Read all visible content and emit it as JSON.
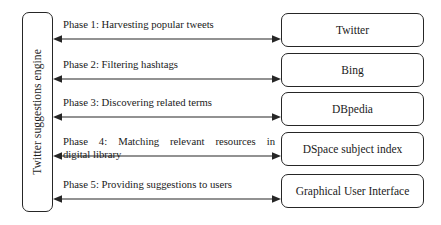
{
  "diagram": {
    "engine": {
      "label": "Twitter suggestions engine"
    },
    "line_color": "#262626",
    "background_color": "#ffffff",
    "phases": [
      {
        "id": "phase-1",
        "label": "Phase 1: Harvesting popular tweets",
        "label_lines": [
          "Phase 1: Harvesting popular tweets"
        ],
        "target": "Twitter",
        "arrow": "bidirectional",
        "justified": false
      },
      {
        "id": "phase-2",
        "label": "Phase 2: Filtering hashtags",
        "label_lines": [
          "Phase 2: Filtering hashtags"
        ],
        "target": "Bing",
        "arrow": "bidirectional",
        "justified": false
      },
      {
        "id": "phase-3",
        "label": "Phase 3: Discovering related terms",
        "label_lines": [
          "Phase 3: Discovering related terms"
        ],
        "target": "DBpedia",
        "arrow": "bidirectional",
        "justified": false
      },
      {
        "id": "phase-4",
        "label": "Phase 4: Matching relevant resources in digital library",
        "label_lines": [
          "Phase 4: Matching relevant resources in",
          "digital library"
        ],
        "target": "DSpace subject index",
        "arrow": "bidirectional",
        "justified": true
      },
      {
        "id": "phase-5",
        "label": "Phase 5: Providing suggestions to users",
        "label_lines": [
          "Phase 5: Providing suggestions to users"
        ],
        "target": "Graphical User Interface",
        "arrow": "bidirectional",
        "justified": false
      }
    ]
  }
}
